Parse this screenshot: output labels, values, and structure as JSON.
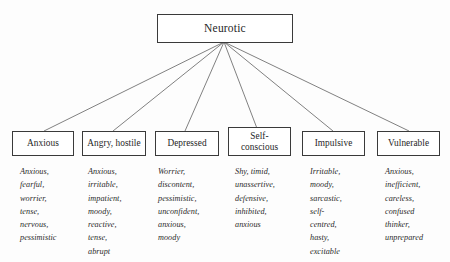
{
  "diagram": {
    "type": "hierarchy-tree",
    "root": {
      "label": "Neurotic"
    },
    "branches": [
      {
        "label": "Anxious",
        "traits": "Anxious,\nfearful,\nworrier,\ntense,\nnervous,\npessimistic"
      },
      {
        "label": "Angry, hostile",
        "traits": "Anxious,\nirritable,\nimpatient,\nmoody,\nreactive,\ntense,\nabrupt"
      },
      {
        "label": "Depressed",
        "traits": "Worrier,\ndiscontent,\npessimistic,\nunconfident,\nanxious,\nmoody"
      },
      {
        "label": "Self-\nconscious",
        "traits": "Shy, timid,\nunassertive,\ndefensive,\ninhibited,\nanxious"
      },
      {
        "label": "Impulsive",
        "traits": "Irritable,\nmoody,\nsarcastic,\nself-\ncentred,\nhasty,\nexcitable"
      },
      {
        "label": "Vulnerable",
        "traits": "Anxious,\ninefficient,\ncareless,\nconfused\nthinker,\nunprepared"
      }
    ],
    "colors": {
      "background": "#fdfdfd",
      "box_fill": "#ffffff",
      "stroke": "#3a3a3a",
      "connector": "#4a4a4a",
      "text": "#262626"
    }
  }
}
